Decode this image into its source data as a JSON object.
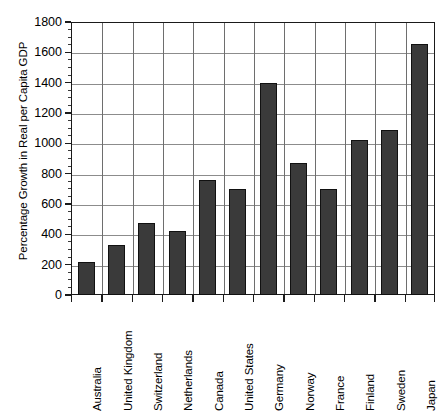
{
  "chart_data": {
    "type": "bar",
    "title": "",
    "subtitle": "",
    "xlabel": "",
    "ylabel": "Percentage Growth in Real per Capita GDP",
    "ylim": [
      0,
      1800
    ],
    "ytick_step": 200,
    "yticks": [
      "0",
      "200",
      "400",
      "600",
      "800",
      "1000",
      "1200",
      "1400",
      "1600",
      "1800"
    ],
    "grid": "horizontal-and-vertical",
    "legend": "none",
    "minor_ticks": true,
    "bar_color": "#3a3a3a",
    "bar_edge_color": "#111111",
    "axis_color": "#1a1a1a",
    "gridline_color": "#8c8c8c",
    "categories": [
      "Australia",
      "United Kingdom",
      "Switzerland",
      "Netherlands",
      "Canada",
      "United States",
      "Germany",
      "Norway",
      "France",
      "Finland",
      "Sweden",
      "Japan"
    ],
    "values": [
      220,
      330,
      475,
      425,
      760,
      700,
      1400,
      870,
      700,
      1020,
      1090,
      1655
    ]
  }
}
